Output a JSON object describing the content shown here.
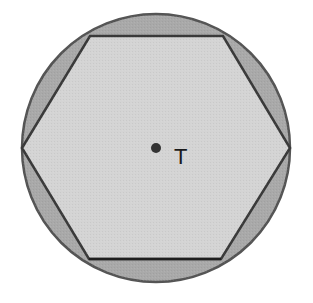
{
  "diagram": {
    "type": "inscribed-hexagon",
    "circle": {
      "cx": 156,
      "cy": 148,
      "r": 134,
      "fill": "#a9a9a9",
      "stroke": "#555555"
    },
    "hexagon": {
      "points": "22,148 90,36 223,36 290,148 221,259 89,259",
      "fill": "#d4d4d4",
      "stroke": "#3a3a3a"
    },
    "center_point": {
      "cx": 156,
      "cy": 148,
      "r": 5,
      "fill": "#333333",
      "label": "T",
      "label_x": 174,
      "label_y": 164
    },
    "colors": {
      "segment_fill": "#a9a9a9",
      "hexagon_fill": "#d4d4d4",
      "outline": "#444444",
      "background": "#ffffff"
    }
  }
}
